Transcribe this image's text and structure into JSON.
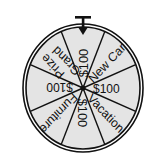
{
  "wheel": {
    "center": [
      83,
      88
    ],
    "radius_x": 60,
    "radius_y": 64,
    "fill_color": "#e4e4e4",
    "line_color": "#111111",
    "sectors": [
      {
        "label": "$100",
        "lines": [
          "$100"
        ],
        "angle": 0
      },
      {
        "label": "New Car",
        "lines": [
          "New Car"
        ],
        "angle": 45
      },
      {
        "label": "$100",
        "lines": [
          "$100"
        ],
        "angle": 90
      },
      {
        "label": "Vacation",
        "lines": [
          "Vacation"
        ],
        "angle": 135
      },
      {
        "label": "$100",
        "lines": [
          "$100"
        ],
        "angle": 180
      },
      {
        "label": "Furniture",
        "lines": [
          "Furniture"
        ],
        "angle": 225
      },
      {
        "label": "$100",
        "lines": [
          "$100"
        ],
        "angle": 270
      },
      {
        "label": "Grand Prize",
        "lines": [
          "Grand",
          "Prize"
        ],
        "angle": 315
      }
    ]
  },
  "pointer": {
    "icon": "arrow-down-pointer-icon"
  }
}
